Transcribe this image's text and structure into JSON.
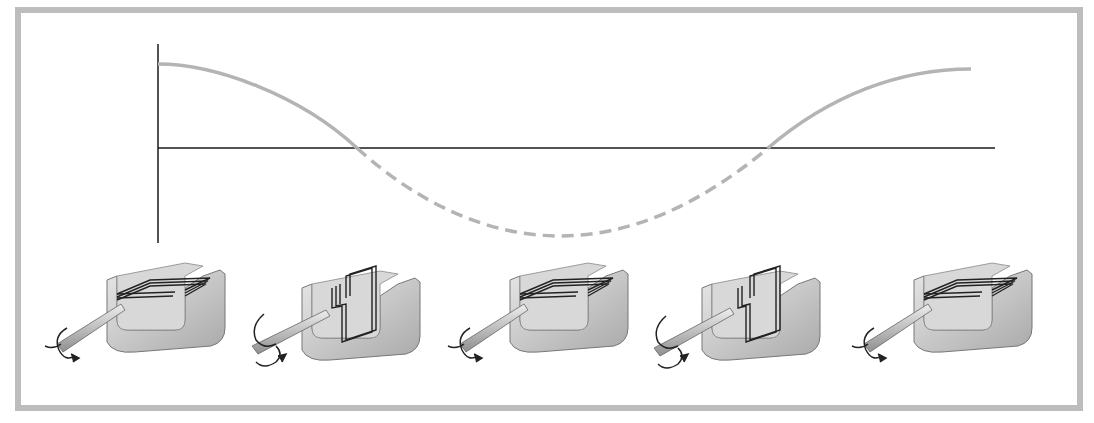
{
  "diagram": {
    "frame_color": "#bdbdbd",
    "axis_color": "#1a1a1a",
    "curve_color": "#b4b4b4",
    "waveform": {
      "shape": "cosine",
      "solid_segments": "above horizontal axis",
      "dashed_segment": "below horizontal axis",
      "points_px": [
        [
          158,
          64
        ],
        [
          357,
          148
        ],
        [
          560,
          236
        ],
        [
          768,
          148
        ],
        [
          971,
          69
        ]
      ]
    },
    "apparatus": [
      {
        "index": 0,
        "coil_orientation": "horizontal"
      },
      {
        "index": 1,
        "coil_orientation": "vertical"
      },
      {
        "index": 2,
        "coil_orientation": "horizontal"
      },
      {
        "index": 3,
        "coil_orientation": "vertical"
      },
      {
        "index": 4,
        "coil_orientation": "horizontal"
      }
    ]
  }
}
